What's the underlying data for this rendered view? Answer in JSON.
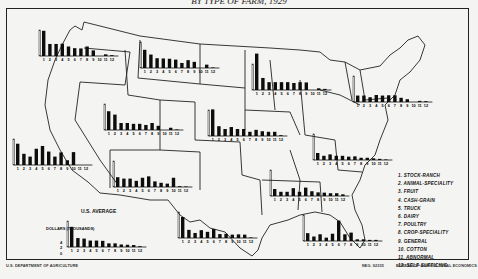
{
  "title": "BY TYPE OF FARM, 1929",
  "legend": {
    "items": [
      "1. STOCK-RANCH",
      "2. ANIMAL-SPECIALITY",
      "3. FRUIT",
      "4. CASH-GRAIN",
      "5. TRUCK",
      "6. DAIRY",
      "7. POULTRY",
      "8. CROP-SPECIALITY",
      "9. GENERAL",
      "10. COTTON",
      "11. ABNORMAL",
      "12. SELF-SUFFICING"
    ]
  },
  "scale": {
    "title": "DOLLARS (THOUSANDS)",
    "ticks": [
      "4",
      "2",
      "0"
    ]
  },
  "us_average_label": "U.S. AVERAGE",
  "footer": {
    "left": "U.S. DEPARTMENT OF AGRICULTURE",
    "neg": "NEG. 92335",
    "right": "BUREAU OF AGRICULTURAL ECONOMICS"
  },
  "chart_data": {
    "type": "bar",
    "ylabel": "Dollars (thousands)",
    "categories": [
      "1",
      "2",
      "3",
      "4",
      "5",
      "6",
      "7",
      "8",
      "9",
      "10",
      "11",
      "12"
    ],
    "category_names": [
      "Stock-ranch",
      "Animal-speciality",
      "Fruit",
      "Cash-grain",
      "Truck",
      "Dairy",
      "Poultry",
      "Crop-speciality",
      "General",
      "Cotton",
      "Abnormal",
      "Self-sufficing"
    ],
    "series": [
      {
        "name": "Pacific Northwest",
        "values": [
          9.0,
          4.3,
          4.3,
          4.4,
          3.4,
          2.8,
          2.7,
          3.4,
          2.0,
          0,
          0.6,
          0.3
        ]
      },
      {
        "name": "Northern Great Plains (Mont.-Dak.)",
        "values": [
          6.5,
          4.8,
          3.5,
          3.4,
          3.3,
          3.0,
          1.8,
          2.8,
          2.2,
          0,
          1.2,
          0.2
        ]
      },
      {
        "name": "Lake States",
        "values": [
          13.0,
          4.3,
          2.8,
          2.8,
          2.8,
          2.8,
          2.5,
          2.8,
          2.7,
          0,
          0.6,
          0.4
        ]
      },
      {
        "name": "Northeast",
        "values": [
          2.3,
          2.3,
          1.7,
          2.5,
          2.3,
          2.4,
          2.4,
          1.5,
          1.0,
          0,
          0.4,
          0.3
        ]
      },
      {
        "name": "Pacific (California)",
        "values": [
          7.6,
          4.0,
          3.0,
          5.8,
          6.8,
          4.8,
          3.0,
          4.5,
          1.7,
          4.6,
          0,
          0
        ]
      },
      {
        "name": "Mountain",
        "values": [
          6.7,
          5.5,
          2.5,
          2.5,
          2.2,
          2.2,
          1.8,
          2.5,
          1.5,
          0,
          0.8,
          0.2
        ]
      },
      {
        "name": "Corn Belt (West North Central)",
        "values": [
          9.5,
          3.5,
          2.5,
          3.2,
          2.5,
          2.5,
          1.5,
          2.2,
          1.7,
          1.5,
          1.5,
          0.3
        ]
      },
      {
        "name": "South Atlantic",
        "values": [
          2.5,
          1.5,
          2.0,
          1.5,
          1.5,
          1.2,
          1.3,
          0.8,
          0.8,
          0.6,
          0.4,
          0.2
        ]
      },
      {
        "name": "Southwest (N.M.-Ariz.)",
        "values": [
          3.5,
          3.0,
          3.0,
          2.2,
          3.3,
          3.8,
          2.0,
          1.5,
          1.2,
          3.3,
          0.3,
          0.2
        ]
      },
      {
        "name": "East South Central",
        "values": [
          2.5,
          1.5,
          1.5,
          2.8,
          1.5,
          3.0,
          1.7,
          1.3,
          1.2,
          1.0,
          1.0,
          0.6
        ]
      },
      {
        "name": "West South Central (Texas)",
        "values": [
          7.5,
          2.9,
          1.8,
          2.8,
          2.2,
          3.2,
          1.4,
          1.5,
          1.2,
          1.3,
          1.2,
          0.2
        ]
      },
      {
        "name": "Florida / Southeast",
        "values": [
          2.8,
          1.6,
          2.4,
          1.2,
          2.6,
          7.3,
          2.4,
          3.0,
          0.6,
          0.6,
          0.4,
          0.4
        ]
      },
      {
        "name": "U.S. Average",
        "values": [
          7.2,
          3.2,
          3.0,
          2.3,
          2.3,
          2.2,
          1.3,
          1.3,
          0.9,
          0.8,
          0.7,
          0.3
        ]
      }
    ],
    "ylim": [
      0,
      14
    ],
    "grid": false,
    "legend_position": "right-bottom"
  }
}
